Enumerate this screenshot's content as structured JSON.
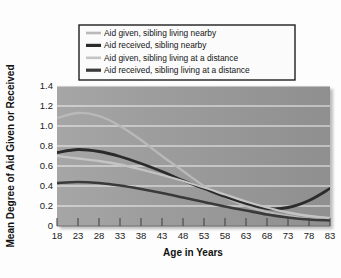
{
  "chart_data": {
    "type": "line",
    "title": "",
    "xlabel": "Age in Years",
    "ylabel": "Mean Degree of Aid Given or Received",
    "xlim": [
      18,
      83
    ],
    "ylim": [
      0,
      1.4
    ],
    "xticks": [
      "18",
      "23",
      "28",
      "33",
      "38",
      "43",
      "48",
      "53",
      "58",
      "63",
      "68",
      "73",
      "78",
      "83"
    ],
    "yticks": [
      "0",
      "0.2",
      "0.4",
      "0.6",
      "0.8",
      "1.0",
      "1.2",
      "1.4"
    ],
    "grid": "horizontal",
    "legend_position": "above-plot",
    "plot_background": "#9c9c9c",
    "gridline_color": "#f2f2f2",
    "x": [
      18,
      23,
      28,
      33,
      38,
      43,
      48,
      53,
      58,
      63,
      68,
      73,
      78,
      83
    ],
    "series": [
      {
        "name": "Aid given, sibling living nearby",
        "color": "#b9b9b9",
        "width": 2.3,
        "values": [
          1.08,
          1.13,
          1.1,
          1.0,
          0.86,
          0.7,
          0.55,
          0.4,
          0.29,
          0.2,
          0.14,
          0.1,
          0.07,
          0.06
        ]
      },
      {
        "name": "Aid received, sibling nearby",
        "color": "#2b2b2b",
        "width": 2.8,
        "values": [
          0.735,
          0.765,
          0.745,
          0.695,
          0.625,
          0.545,
          0.455,
          0.375,
          0.295,
          0.225,
          0.175,
          0.185,
          0.255,
          0.375
        ]
      },
      {
        "name": "Aid given, sibling living at a distance",
        "color": "#c4c4c4",
        "width": 2.3,
        "values": [
          0.7,
          0.675,
          0.65,
          0.615,
          0.565,
          0.51,
          0.45,
          0.385,
          0.315,
          0.245,
          0.185,
          0.135,
          0.1,
          0.08
        ]
      },
      {
        "name": "Aid received, sibling living at a distance",
        "color": "#3a3a3a",
        "width": 2.6,
        "values": [
          0.43,
          0.44,
          0.43,
          0.405,
          0.37,
          0.33,
          0.285,
          0.24,
          0.195,
          0.155,
          0.115,
          0.085,
          0.065,
          0.055
        ]
      }
    ]
  },
  "legend": {
    "items": [
      {
        "label": "Aid given, sibling living nearby",
        "color": "#b9b9b9"
      },
      {
        "label": "Aid received, sibling nearby",
        "color": "#2b2b2b"
      },
      {
        "label": "Aid given, sibling living at a distance",
        "color": "#c4c4c4"
      },
      {
        "label": "Aid received, sibling living at a distance",
        "color": "#3a3a3a"
      }
    ]
  }
}
